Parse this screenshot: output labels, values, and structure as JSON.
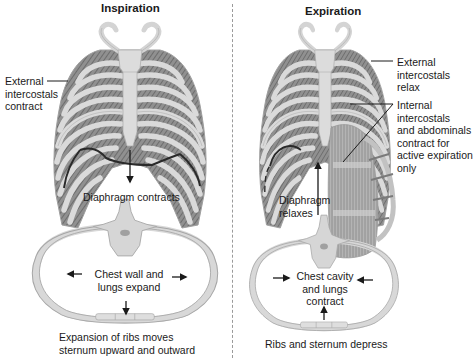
{
  "diagram": {
    "colors": {
      "bone": "#d9d9d9",
      "bone_edge": "#a8a8a8",
      "muscle": "#8c8c8c",
      "muscle_dark": "#6e6e6e",
      "diaphragm_line": "#2a2a2a",
      "text": "#1a1a1a",
      "divider": "#9a9a9a"
    },
    "inspiration": {
      "title": "Inspiration",
      "labels": {
        "external_intercostals": [
          "External",
          "intercostals",
          "contract"
        ],
        "diaphragm": "Diaphragm contracts",
        "cross_section": [
          "Chest wall and",
          "lungs expand"
        ],
        "caption": [
          "Expansion of ribs moves",
          "sternum upward and outward"
        ]
      },
      "arrows": [
        "diaphragm-down",
        "chest-left-out",
        "chest-right-out",
        "sternum-down"
      ]
    },
    "expiration": {
      "title": "Expiration",
      "labels": {
        "external_intercostals": [
          "External",
          "intercostals",
          "relax"
        ],
        "internal_intercostals": [
          "Internal",
          "intercostals",
          "and abdominals",
          "contract for",
          "active expiration",
          "only"
        ],
        "diaphragm": [
          "Diaphragm",
          "relaxes"
        ],
        "cross_section": [
          "Chest cavity",
          "and lungs",
          "contract"
        ],
        "caption": "Ribs and sternum depress"
      },
      "arrows": [
        "diaphragm-up",
        "chest-left-in",
        "chest-right-in",
        "sternum-up"
      ]
    }
  }
}
